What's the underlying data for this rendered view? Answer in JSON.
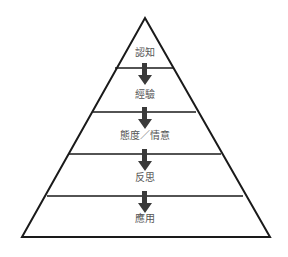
{
  "diagram": {
    "type": "pyramid",
    "direction": "top-to-bottom",
    "layers": [
      {
        "label": "認知"
      },
      {
        "label": "經驗"
      },
      {
        "label": "態度／情意"
      },
      {
        "label": "反思"
      },
      {
        "label": "應用"
      }
    ],
    "connector": "down-arrow",
    "colors": {
      "outline": "#1a1a1a",
      "arrow": "#3a3a3a",
      "label": "#555555",
      "background": "#ffffff"
    }
  }
}
